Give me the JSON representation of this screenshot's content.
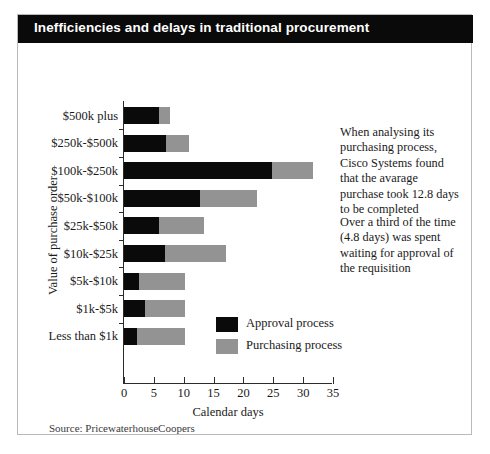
{
  "title": "Inefficiencies and delays in traditional procurement",
  "source": "Source: PricewaterhouseCoopers",
  "annotations": [
    "When analysing its purchasing process, Cisco Systems found that the avarage purchase took 12.8 days to be completed",
    "Over a third of the time (4.8 days) was spent waiting for approval of the requisition"
  ],
  "legend": {
    "approval_label": "Approval process",
    "purchasing_label": "Purchasing process"
  },
  "colors": {
    "approval": "#0a0a0a",
    "purchasing": "#939393",
    "title_bar": "#0a0a0a",
    "title_text": "#ffffff",
    "frame": "#b9b9b9"
  },
  "chart_data": {
    "type": "bar",
    "orientation": "horizontal",
    "stacked": true,
    "title": "Inefficiencies and delays in traditional procurement",
    "xlabel": "Calendar days",
    "ylabel": "Value of purchase order",
    "xlim": [
      0,
      35
    ],
    "xticks": [
      0,
      5,
      10,
      15,
      20,
      25,
      30,
      35
    ],
    "grid": false,
    "legend_position": "inside-bottom-center",
    "categories": [
      "$500k plus",
      "$250k-$500k",
      "$100k-$250k",
      "$50k-$100k",
      "$25k-$50k",
      "$10k-$25k",
      "$5k-$10k",
      "$1k-$5k",
      "Less than $1k"
    ],
    "series": [
      {
        "name": "Approval process",
        "color": "#0a0a0a",
        "values": [
          5.8,
          7.1,
          24.8,
          12.8,
          5.8,
          6.8,
          2.5,
          3.6,
          2.1
        ]
      },
      {
        "name": "Purchasing process",
        "color": "#939393",
        "values": [
          1.9,
          3.8,
          6.8,
          9.5,
          7.6,
          10.3,
          7.7,
          6.6,
          8.1
        ]
      }
    ],
    "totals": [
      7.7,
      10.9,
      31.6,
      22.3,
      13.4,
      17.1,
      10.2,
      10.2,
      10.2
    ]
  }
}
